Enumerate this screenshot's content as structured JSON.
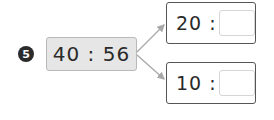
{
  "problem": {
    "number": "5",
    "ratio": "40 : 56",
    "answers": [
      {
        "label": "20 :",
        "value": ""
      },
      {
        "label": "10 :",
        "value": ""
      }
    ]
  },
  "colors": {
    "badge": "#2b2b2b",
    "ratio_box_fill": "#e6e6e6",
    "arrow": "#a8a8a8",
    "answer_border": "#555555"
  }
}
